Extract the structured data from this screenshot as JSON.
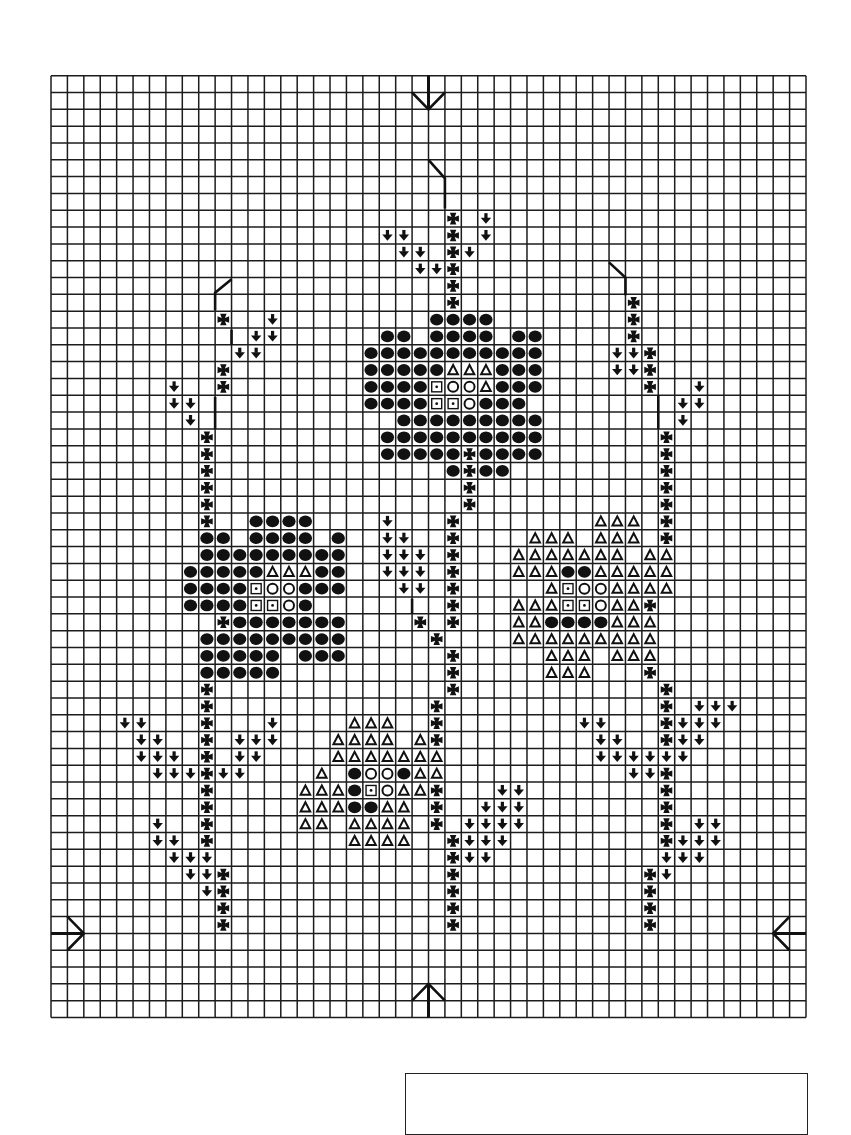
{
  "page": {
    "width": 851,
    "height": 1095,
    "background": "#ffffff"
  },
  "grid": {
    "left": 51,
    "top": 75.7,
    "right": 806,
    "bottom": 1017.5,
    "cols": 46,
    "rows": 56,
    "line_color": "#1c1c1c",
    "line_width": 1.5
  },
  "symbol_key": {
    "F": "filled-circle",
    "O": "hollow-circle",
    "T": "hollow-triangle",
    "S": "dotted-square",
    "X": "maltese-cross",
    "L": "down-arrow-leaf"
  },
  "ink_color": "#111111",
  "pattern": {
    "8": [
      [
        24,
        "X"
      ],
      [
        26,
        "L"
      ]
    ],
    "9": [
      [
        20,
        "LL"
      ],
      [
        24,
        "X"
      ],
      [
        26,
        "L"
      ]
    ],
    "10": [
      [
        21,
        "LL"
      ],
      [
        24,
        "XL"
      ]
    ],
    "11": [
      [
        22,
        "LLX"
      ]
    ],
    "12": [
      [
        24,
        "X"
      ]
    ],
    "13": [
      [
        24,
        "X"
      ],
      [
        35,
        "X"
      ]
    ],
    "14": [
      [
        10,
        "X"
      ],
      [
        13,
        "L"
      ],
      [
        23,
        "FFFF"
      ],
      [
        35,
        "X"
      ]
    ],
    "15": [
      [
        12,
        "LL"
      ],
      [
        20,
        "FF"
      ],
      [
        23,
        "FFFF"
      ],
      [
        28,
        "FF"
      ],
      [
        35,
        "X"
      ]
    ],
    "16": [
      [
        11,
        "LL"
      ],
      [
        19,
        "FFFFFFFFFFF"
      ],
      [
        34,
        "LLX"
      ]
    ],
    "17": [
      [
        10,
        "X"
      ],
      [
        19,
        "FFFFFTTTFFF"
      ],
      [
        34,
        "LLX"
      ]
    ],
    "18": [
      [
        7,
        "L"
      ],
      [
        10,
        "X"
      ],
      [
        19,
        "FFFFSOOTFFF"
      ],
      [
        36,
        "X"
      ],
      [
        39,
        "L"
      ]
    ],
    "19": [
      [
        7,
        "LL"
      ],
      [
        19,
        "FFFFSSOFFF"
      ],
      [
        38,
        "LL"
      ]
    ],
    "20": [
      [
        8,
        "L"
      ],
      [
        21,
        "FFFFFFFFF"
      ],
      [
        38,
        "L"
      ]
    ],
    "21": [
      [
        9,
        "X"
      ],
      [
        20,
        "FFFFFFFFFF"
      ],
      [
        37,
        "X"
      ]
    ],
    "22": [
      [
        9,
        "X"
      ],
      [
        20,
        "FFFFFXFFFF"
      ],
      [
        37,
        "X"
      ]
    ],
    "23": [
      [
        9,
        "X"
      ],
      [
        24,
        "FXFF"
      ],
      [
        37,
        "X"
      ]
    ],
    "24": [
      [
        9,
        "X"
      ],
      [
        25,
        "X"
      ],
      [
        37,
        "X"
      ]
    ],
    "25": [
      [
        9,
        "X"
      ],
      [
        25,
        "X"
      ],
      [
        37,
        "X"
      ]
    ],
    "26": [
      [
        9,
        "X"
      ],
      [
        12,
        "FFFF"
      ],
      [
        20,
        "L"
      ],
      [
        24,
        "X"
      ],
      [
        33,
        "TTT"
      ],
      [
        37,
        "X"
      ]
    ],
    "27": [
      [
        9,
        "FF"
      ],
      [
        12,
        "FFFF"
      ],
      [
        17,
        "F"
      ],
      [
        20,
        "LL"
      ],
      [
        24,
        "X"
      ],
      [
        29,
        "TTT"
      ],
      [
        33,
        "TTT"
      ],
      [
        37,
        "X"
      ]
    ],
    "28": [
      [
        9,
        "FFFFFFFFF"
      ],
      [
        20,
        "LLL"
      ],
      [
        24,
        "X"
      ],
      [
        28,
        "TTTTTTT"
      ],
      [
        36,
        "TT"
      ]
    ],
    "29": [
      [
        8,
        "FFFFFTTTFF"
      ],
      [
        20,
        "LLL"
      ],
      [
        24,
        "X"
      ],
      [
        28,
        "TTTFFTTTTT"
      ]
    ],
    "30": [
      [
        8,
        "FFFFSOOFFF"
      ],
      [
        21,
        "LL"
      ],
      [
        24,
        "X"
      ],
      [
        30,
        "TSOOTTTT"
      ]
    ],
    "31": [
      [
        8,
        "FFFFSSOF"
      ],
      [
        24,
        "X"
      ],
      [
        28,
        "TTTSSOTTX"
      ]
    ],
    "32": [
      [
        10,
        "XFFFFFFF"
      ],
      [
        22,
        "X"
      ],
      [
        24,
        "X"
      ],
      [
        28,
        "TTFFFFTTT"
      ]
    ],
    "33": [
      [
        9,
        "FFFFFFFFF"
      ],
      [
        23,
        "X"
      ],
      [
        28,
        "TTTTTTTTT"
      ]
    ],
    "34": [
      [
        9,
        "FFFFF"
      ],
      [
        15,
        "FFF"
      ],
      [
        24,
        "X"
      ],
      [
        30,
        "TTT"
      ],
      [
        34,
        "TTT"
      ]
    ],
    "35": [
      [
        9,
        "FFFFF"
      ],
      [
        24,
        "X"
      ],
      [
        30,
        "TTT"
      ],
      [
        36,
        "X"
      ]
    ],
    "36": [
      [
        9,
        "X"
      ],
      [
        24,
        "X"
      ],
      [
        37,
        "X"
      ]
    ],
    "37": [
      [
        9,
        "X"
      ],
      [
        23,
        "X"
      ],
      [
        37,
        "X"
      ],
      [
        39,
        "LLL"
      ]
    ],
    "38": [
      [
        4,
        "LL"
      ],
      [
        9,
        "X"
      ],
      [
        13,
        "L"
      ],
      [
        18,
        "TTT"
      ],
      [
        23,
        "X"
      ],
      [
        32,
        "LL"
      ],
      [
        37,
        "XLLL"
      ]
    ],
    "39": [
      [
        5,
        "LL"
      ],
      [
        9,
        "X"
      ],
      [
        11,
        "LLL"
      ],
      [
        17,
        "TTTT"
      ],
      [
        22,
        "TX"
      ],
      [
        33,
        "LL"
      ],
      [
        37,
        "XLL"
      ]
    ],
    "40": [
      [
        5,
        "LLL"
      ],
      [
        9,
        "X"
      ],
      [
        11,
        "LL"
      ],
      [
        17,
        "TTTTTTT"
      ],
      [
        33,
        "LLLLLL"
      ]
    ],
    "41": [
      [
        6,
        "LLLXLL"
      ],
      [
        16,
        "T"
      ],
      [
        18,
        "FOOFTT"
      ],
      [
        35,
        "LLX"
      ]
    ],
    "42": [
      [
        9,
        "X"
      ],
      [
        15,
        "TTTFSOTTX"
      ],
      [
        27,
        "LL"
      ],
      [
        37,
        "X"
      ]
    ],
    "43": [
      [
        9,
        "X"
      ],
      [
        15,
        "TTTFFTT"
      ],
      [
        23,
        "X"
      ],
      [
        26,
        "LLL"
      ],
      [
        37,
        "X"
      ]
    ],
    "44": [
      [
        6,
        "L"
      ],
      [
        9,
        "X"
      ],
      [
        15,
        "TT"
      ],
      [
        18,
        "TTTT"
      ],
      [
        23,
        "X"
      ],
      [
        25,
        "LLLL"
      ],
      [
        37,
        "X"
      ],
      [
        39,
        "LL"
      ]
    ],
    "45": [
      [
        6,
        "LL"
      ],
      [
        9,
        "X"
      ],
      [
        18,
        "TTTT"
      ],
      [
        24,
        "XLLL"
      ],
      [
        37,
        "XLLL"
      ]
    ],
    "46": [
      [
        7,
        "LLL"
      ],
      [
        24,
        "XLL"
      ],
      [
        37,
        "LLL"
      ]
    ],
    "47": [
      [
        8,
        "LLX"
      ],
      [
        24,
        "X"
      ],
      [
        36,
        "XL"
      ]
    ],
    "48": [
      [
        9,
        "LX"
      ],
      [
        24,
        "X"
      ],
      [
        36,
        "X"
      ]
    ],
    "49": [
      [
        10,
        "X"
      ],
      [
        24,
        "X"
      ],
      [
        36,
        "X"
      ]
    ],
    "50": [
      [
        10,
        "X"
      ],
      [
        24,
        "X"
      ],
      [
        36,
        "X"
      ]
    ]
  },
  "stem_lines": [
    {
      "name": "top-stem-line",
      "points": [
        [
          23,
          5.0
        ],
        [
          24,
          6.1
        ],
        [
          24,
          7.9
        ]
      ]
    },
    {
      "name": "upper-left-stem-line",
      "points": [
        [
          11,
          12.1
        ],
        [
          10,
          12.9
        ],
        [
          10,
          13.95
        ]
      ]
    },
    {
      "name": "left-leaf-stem-line",
      "points": [
        [
          11,
          15.1
        ],
        [
          11,
          16.0
        ]
      ]
    },
    {
      "name": "left-stem-line",
      "points": [
        [
          10,
          19.1
        ],
        [
          10,
          21.0
        ]
      ]
    },
    {
      "name": "upper-right-stem-line",
      "points": [
        [
          34,
          11.1
        ],
        [
          35,
          12.0
        ],
        [
          35,
          13.05
        ]
      ]
    },
    {
      "name": "right-stem-line",
      "points": [
        [
          37,
          19.0
        ],
        [
          37,
          21.0
        ]
      ]
    },
    {
      "name": "center-leaf-stem-line",
      "points": [
        [
          22,
          31.1
        ],
        [
          22,
          32.0
        ]
      ]
    }
  ],
  "center_arrows": [
    {
      "name": "center-arrow-top-icon",
      "direction": "down",
      "shaft": [
        [
          23,
          0
        ],
        [
          23,
          2
        ]
      ],
      "head": [
        [
          22,
          1
        ],
        [
          23,
          2
        ],
        [
          24,
          1
        ]
      ]
    },
    {
      "name": "center-arrow-bottom-icon",
      "direction": "up",
      "shaft": [
        [
          23,
          56
        ],
        [
          23,
          54
        ]
      ],
      "head": [
        [
          22,
          55
        ],
        [
          23,
          54
        ],
        [
          24,
          55
        ]
      ]
    },
    {
      "name": "center-arrow-left-icon",
      "direction": "right",
      "shaft": [
        [
          0,
          51
        ],
        [
          2,
          51
        ]
      ],
      "head": [
        [
          1,
          50
        ],
        [
          2,
          51
        ],
        [
          1,
          52
        ]
      ]
    },
    {
      "name": "center-arrow-right-icon",
      "direction": "left",
      "shaft": [
        [
          46,
          51
        ],
        [
          44,
          51
        ]
      ],
      "head": [
        [
          45,
          50
        ],
        [
          44,
          51
        ],
        [
          45,
          52
        ]
      ]
    }
  ],
  "blank_box": {
    "left": 405,
    "top": 1073,
    "right": 806
  }
}
